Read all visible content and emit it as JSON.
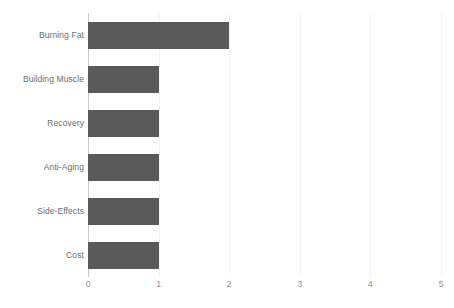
{
  "chart_data": {
    "type": "bar",
    "orientation": "horizontal",
    "title": "",
    "subtitle": "",
    "xlabel": "",
    "ylabel": "",
    "categories": [
      "Burning Fat",
      "Building Muscle",
      "Recovery",
      "Anti-Aging",
      "Side-Effects",
      "Cost"
    ],
    "values": [
      2,
      1,
      1,
      1,
      1,
      1
    ],
    "xlim": [
      0,
      5
    ],
    "xticks": [
      0,
      1,
      2,
      3,
      4,
      5
    ],
    "xtick_labels": [
      "0",
      "1",
      "2",
      "3",
      "4",
      "5"
    ],
    "grid": true,
    "grid_axis": "x",
    "legend": false,
    "legend_position": "none",
    "bar_color": "#595959",
    "grid_color": "#f4f4f4",
    "axis_color": "#c9c9c9",
    "label_color": "#6b6b6b",
    "tick_label_color": "#8a8a8a",
    "background": "#ffffff",
    "annotations": []
  }
}
